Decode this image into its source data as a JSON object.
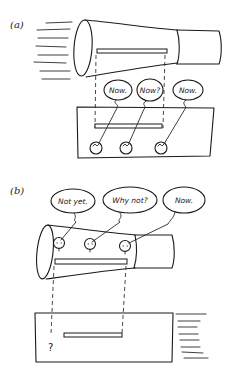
{
  "panels": [
    {
      "id": "a",
      "label": "(a)",
      "bubbles": [
        "Now.",
        "Now?",
        "Now."
      ],
      "description": "Moving tapered tube (contracted) passing over stationary box with clocks; rod in tube aligned with rod in box"
    },
    {
      "id": "b",
      "label": "(b)",
      "bubbles": [
        "Not yet.",
        "Why not?",
        "Now."
      ],
      "description": "Tube frame with clocks; box moving right; rod end marked with question mark",
      "question_mark": "?"
    }
  ],
  "colors": {
    "ink": "#1a1a1a",
    "background": "#ffffff"
  }
}
